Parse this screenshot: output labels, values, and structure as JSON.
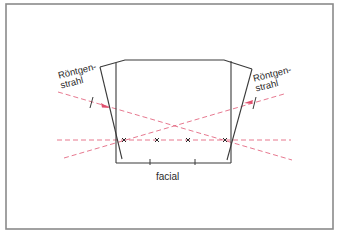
{
  "figure": {
    "labels": {
      "ray_left_line1": "Röntgen-",
      "ray_left_line2": "strahl",
      "ray_right_line1": "Röntgen-",
      "ray_right_line2": "strahl",
      "bottom_label": "facial"
    },
    "markers": {
      "symbol": "x",
      "count": 4
    },
    "colors": {
      "frame": "#8a8a8a",
      "outline": "#3a3a3a",
      "ray": "#e0506e",
      "ray_light": "#e8a0ad"
    }
  }
}
